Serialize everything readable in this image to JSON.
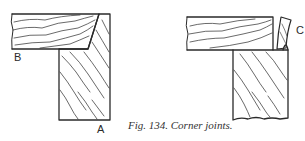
{
  "figure": {
    "caption": "Fig. 134. Corner joints.",
    "labels": {
      "a": "A",
      "b": "B",
      "c": "C"
    },
    "colors": {
      "ink": "#2a2a2a",
      "background": "#ffffff"
    },
    "drawings": [
      {
        "name": "mitred-corner-joint",
        "parts": [
          "board-b-horizontal",
          "board-a-vertical"
        ]
      },
      {
        "name": "butt-corner-joint-with-offcut",
        "parts": [
          "horizontal-board",
          "vertical-board",
          "offcut-c"
        ]
      }
    ]
  }
}
